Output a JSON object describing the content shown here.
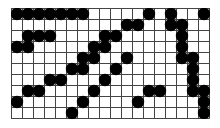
{
  "board": {
    "cols": 18,
    "rows": 10,
    "cell_size": 11,
    "line_color": "#444444",
    "stone_color": "#000000",
    "background": "#ffffff",
    "stones": [
      [
        0,
        0
      ],
      [
        0,
        1
      ],
      [
        0,
        2
      ],
      [
        0,
        3
      ],
      [
        0,
        4
      ],
      [
        0,
        5
      ],
      [
        0,
        6
      ],
      [
        0,
        12
      ],
      [
        0,
        14
      ],
      [
        0,
        17
      ],
      [
        1,
        10
      ],
      [
        1,
        11
      ],
      [
        1,
        14
      ],
      [
        1,
        15
      ],
      [
        2,
        1
      ],
      [
        2,
        2
      ],
      [
        2,
        3
      ],
      [
        2,
        8
      ],
      [
        2,
        9
      ],
      [
        2,
        15
      ],
      [
        3,
        0
      ],
      [
        3,
        1
      ],
      [
        3,
        7
      ],
      [
        3,
        8
      ],
      [
        3,
        15
      ],
      [
        4,
        6
      ],
      [
        4,
        7
      ],
      [
        4,
        10
      ],
      [
        4,
        15
      ],
      [
        4,
        16
      ],
      [
        5,
        5
      ],
      [
        5,
        6
      ],
      [
        5,
        9
      ],
      [
        5,
        16
      ],
      [
        6,
        3
      ],
      [
        6,
        4
      ],
      [
        6,
        8
      ],
      [
        6,
        16
      ],
      [
        7,
        1
      ],
      [
        7,
        2
      ],
      [
        7,
        7
      ],
      [
        7,
        12
      ],
      [
        7,
        13
      ],
      [
        7,
        16
      ],
      [
        7,
        17
      ],
      [
        8,
        0
      ],
      [
        8,
        6
      ],
      [
        8,
        11
      ],
      [
        8,
        17
      ],
      [
        9,
        5
      ],
      [
        9,
        17
      ]
    ]
  }
}
